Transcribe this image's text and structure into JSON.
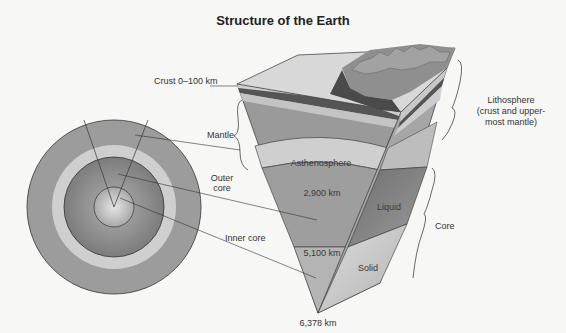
{
  "title": "Structure of the Earth",
  "labels": {
    "crust": "Crust 0–100 km",
    "mantle": "Mantle",
    "outer_core_1": "Outer",
    "outer_core_2": "core",
    "inner_core": "Inner core",
    "lithosphere_1": "Lithosphere",
    "lithosphere_2": "(crust and upper-",
    "lithosphere_3": "most mantle)",
    "asthenosphere": "Asthenosphere",
    "depth_2900": "2,900 km",
    "liquid": "Liquid",
    "depth_5100": "5,100 km",
    "solid": "Solid",
    "core": "Core",
    "depth_6378": "6,378 km"
  },
  "colors": {
    "background": "#f7f7f5",
    "mantle": "#9a9a9a",
    "asthenosphere": "#cfcfcf",
    "outer_core": "#8a8a8a",
    "inner_core": "#b8b8b8",
    "crust_dark": "#555555",
    "line": "#333333"
  }
}
